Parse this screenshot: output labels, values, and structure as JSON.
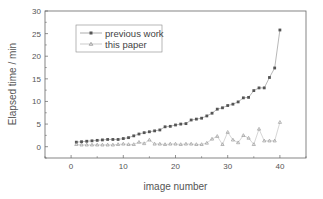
{
  "chart_data": {
    "type": "line",
    "title": "",
    "xlabel": "image number",
    "ylabel": "Elapsed time / min",
    "xlim": [
      -5,
      45
    ],
    "ylim": [
      -2.5,
      30
    ],
    "xticks": [
      0,
      10,
      20,
      30,
      40
    ],
    "yticks": [
      0,
      5,
      10,
      15,
      20,
      25,
      30
    ],
    "grid": false,
    "legend_position": "upper left",
    "x": [
      1,
      2,
      3,
      4,
      5,
      6,
      7,
      8,
      9,
      10,
      11,
      12,
      13,
      14,
      15,
      16,
      17,
      18,
      19,
      20,
      21,
      22,
      23,
      24,
      25,
      26,
      27,
      28,
      29,
      30,
      31,
      32,
      33,
      34,
      35,
      36,
      37,
      38,
      39,
      40
    ],
    "series": [
      {
        "name": "previous work",
        "marker": "square",
        "color": "#555555",
        "values": [
          1.0,
          1.1,
          1.2,
          1.3,
          1.4,
          1.5,
          1.6,
          1.6,
          1.6,
          1.8,
          2.0,
          2.4,
          2.8,
          3.1,
          3.3,
          3.5,
          3.7,
          4.4,
          4.5,
          4.8,
          5.0,
          5.1,
          5.9,
          6.1,
          6.3,
          6.8,
          7.4,
          8.3,
          8.6,
          9.1,
          9.4,
          9.9,
          10.8,
          10.9,
          12.4,
          13.0,
          13.0,
          15.3,
          17.4,
          25.8
        ]
      },
      {
        "name": "this paper",
        "marker": "triangle",
        "color": "#999999",
        "values": [
          0.5,
          0.4,
          0.4,
          0.4,
          0.4,
          0.4,
          0.4,
          0.4,
          0.5,
          0.6,
          0.5,
          0.5,
          1.0,
          0.7,
          1.5,
          0.6,
          0.6,
          0.5,
          0.6,
          0.6,
          0.5,
          0.6,
          0.6,
          0.5,
          0.5,
          0.8,
          1.7,
          2.3,
          0.5,
          3.2,
          1.5,
          0.9,
          2.5,
          1.9,
          0.5,
          3.9,
          1.3,
          1.3,
          1.3,
          5.4
        ]
      }
    ]
  }
}
